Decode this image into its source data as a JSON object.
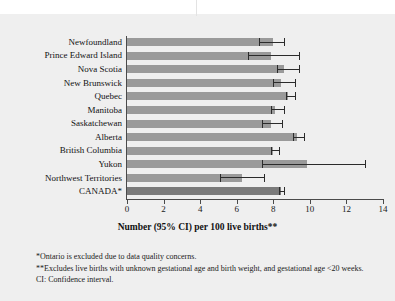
{
  "chart_data": {
    "type": "bar",
    "orientation": "horizontal",
    "title": "",
    "xlabel": "Number (95% CI) per 100 live births**",
    "ylabel": "",
    "xlim": [
      0,
      14
    ],
    "xticks": [
      0,
      2,
      4,
      6,
      8,
      10,
      12,
      14
    ],
    "xticklabels": [
      "0",
      "2",
      "4",
      "6",
      "8",
      "10",
      "12",
      "14"
    ],
    "grid": false,
    "legend": "none",
    "categories": [
      "Newfoundland",
      "Prince Edward Island",
      "Nova Scotia",
      "New Brunswick",
      "Quebec",
      "Manitoba",
      "Saskatchewan",
      "Alberta",
      "British Columbia",
      "Yukon",
      "Northwest Territories",
      "CANADA*"
    ],
    "values": [
      8.0,
      7.9,
      8.6,
      8.4,
      8.8,
      8.1,
      7.9,
      9.3,
      8.0,
      9.85,
      6.3,
      8.4
    ],
    "ci_lower": [
      7.2,
      6.6,
      8.2,
      8.0,
      8.7,
      7.9,
      7.4,
      9.1,
      7.9,
      7.4,
      5.1,
      8.3
    ],
    "ci_upper": [
      8.6,
      9.4,
      9.4,
      9.2,
      9.2,
      8.6,
      8.5,
      9.7,
      8.3,
      13.0,
      7.5,
      8.6
    ],
    "highlight_index": 11,
    "bar_color": "#9a9a9a",
    "highlight_bar_color": "#7a7a7a",
    "error_bar_color": "#2b2b2b",
    "axis_color": "#4a4a4a",
    "background_color": "#efefef"
  },
  "footnotes": {
    "one": "*Ontario is excluded due to data quality concerns.",
    "two": "**Excludes live births with unknown gestational age and birth weight, and gestational age <20 weeks. CI: Confidence interval."
  }
}
